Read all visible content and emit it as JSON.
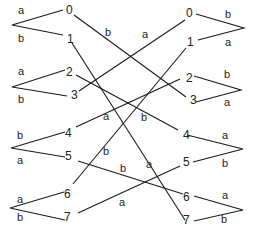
{
  "diagram": {
    "left_nodes": [
      {
        "id": "0",
        "label": "0",
        "x": 69,
        "y": 10
      },
      {
        "id": "1",
        "label": "1",
        "x": 69,
        "y": 38
      },
      {
        "id": "2",
        "label": "2",
        "x": 69,
        "y": 72
      },
      {
        "id": "3",
        "label": "3",
        "x": 74,
        "y": 94
      },
      {
        "id": "4",
        "label": "4",
        "x": 68,
        "y": 132
      },
      {
        "id": "5",
        "label": "5",
        "x": 69,
        "y": 155
      },
      {
        "id": "6",
        "label": "6",
        "x": 67,
        "y": 193
      },
      {
        "id": "7",
        "label": "7",
        "x": 67,
        "y": 216
      }
    ],
    "right_nodes": [
      {
        "id": "0",
        "label": "0",
        "x": 187,
        "y": 12
      },
      {
        "id": "1",
        "label": "1",
        "x": 188,
        "y": 41
      },
      {
        "id": "2",
        "label": "2",
        "x": 187,
        "y": 77
      },
      {
        "id": "3",
        "label": "3",
        "x": 193,
        "y": 99
      },
      {
        "id": "4",
        "label": "4",
        "x": 186,
        "y": 134
      },
      {
        "id": "5",
        "label": "5",
        "x": 186,
        "y": 161
      },
      {
        "id": "6",
        "label": "6",
        "x": 186,
        "y": 196
      },
      {
        "id": "7",
        "label": "7",
        "x": 186,
        "y": 218
      }
    ],
    "left_branches": [
      {
        "pair": [
          "0",
          "1"
        ],
        "top_label": "a",
        "bottom_label": "b"
      },
      {
        "pair": [
          "2",
          "3"
        ],
        "top_label": "a",
        "bottom_label": "b"
      },
      {
        "pair": [
          "4",
          "5"
        ],
        "top_label": "b",
        "bottom_label": "a"
      },
      {
        "pair": [
          "6",
          "7"
        ],
        "top_label": "a",
        "bottom_label": "b"
      }
    ],
    "right_branches": [
      {
        "pair": [
          "0",
          "1"
        ],
        "top_label": "b",
        "bottom_label": "a"
      },
      {
        "pair": [
          "2",
          "3"
        ],
        "top_label": "b",
        "bottom_label": "a"
      },
      {
        "pair": [
          "4",
          "5"
        ],
        "top_label": "a",
        "bottom_label": "b"
      },
      {
        "pair": [
          "6",
          "7"
        ],
        "top_label": "a",
        "bottom_label": "b"
      }
    ],
    "cross_edges": [
      {
        "from": "0",
        "to": "3",
        "label": "b"
      },
      {
        "from": "3",
        "to": "0",
        "label": "a"
      },
      {
        "from": "1",
        "to": "7",
        "label": "a"
      },
      {
        "from": "2",
        "to": "4",
        "label": "b"
      },
      {
        "from": "4",
        "to": "2",
        "label": "a"
      },
      {
        "from": "6",
        "to": "1",
        "label": "b"
      },
      {
        "from": "5",
        "to": "6",
        "label": "b"
      },
      {
        "from": "7",
        "to": "5",
        "label": "a"
      }
    ]
  }
}
